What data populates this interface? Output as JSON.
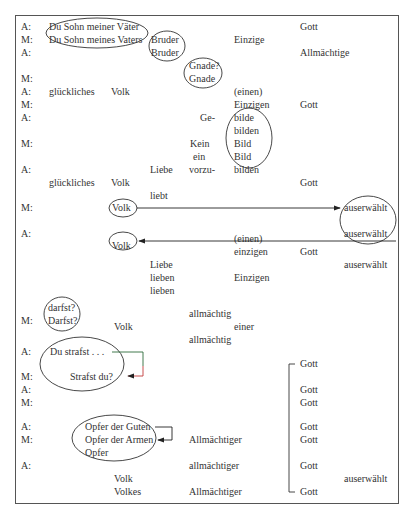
{
  "speakers": [
    {
      "label": "A:",
      "x": 21,
      "y": 21
    },
    {
      "label": "M:",
      "x": 21,
      "y": 34
    },
    {
      "label": "A:",
      "x": 21,
      "y": 47
    },
    {
      "label": "M:",
      "x": 21,
      "y": 73
    },
    {
      "label": "A:",
      "x": 21,
      "y": 86
    },
    {
      "label": "M:",
      "x": 21,
      "y": 99
    },
    {
      "label": "A:",
      "x": 21,
      "y": 112
    },
    {
      "label": "M:",
      "x": 21,
      "y": 138
    },
    {
      "label": "A:",
      "x": 21,
      "y": 164
    },
    {
      "label": "M:",
      "x": 21,
      "y": 202
    },
    {
      "label": "A:",
      "x": 21,
      "y": 228
    },
    {
      "label": "M:",
      "x": 21,
      "y": 315
    },
    {
      "label": "A:",
      "x": 21,
      "y": 346
    },
    {
      "label": "M:",
      "x": 21,
      "y": 371
    },
    {
      "label": "A:",
      "x": 21,
      "y": 384
    },
    {
      "label": "M:",
      "x": 21,
      "y": 397
    },
    {
      "label": "A:",
      "x": 21,
      "y": 421
    },
    {
      "label": "M:",
      "x": 21,
      "y": 434
    },
    {
      "label": "A:",
      "x": 21,
      "y": 460
    }
  ],
  "words": [
    {
      "text": "Du Sohn meiner Väter",
      "x": 49,
      "y": 21
    },
    {
      "text": "Du Sohn meines Vaters",
      "x": 49,
      "y": 34
    },
    {
      "text": "Bruder",
      "x": 151,
      "y": 34
    },
    {
      "text": "Bruder",
      "x": 151,
      "y": 47
    },
    {
      "text": "Einzige",
      "x": 234,
      "y": 34
    },
    {
      "text": "Gott",
      "x": 300,
      "y": 21
    },
    {
      "text": "Allmächtige",
      "x": 300,
      "y": 47
    },
    {
      "text": "Gnade?",
      "x": 189,
      "y": 60
    },
    {
      "text": "Gnade",
      "x": 189,
      "y": 73
    },
    {
      "text": "glückliches",
      "x": 49,
      "y": 86
    },
    {
      "text": "Volk",
      "x": 111,
      "y": 86
    },
    {
      "text": "(einen)",
      "x": 234,
      "y": 86
    },
    {
      "text": "Einzigen",
      "x": 234,
      "y": 99
    },
    {
      "text": "Gott",
      "x": 300,
      "y": 99
    },
    {
      "text": "Ge-",
      "x": 200,
      "y": 112
    },
    {
      "text": "bilde",
      "x": 234,
      "y": 112
    },
    {
      "text": "bilden",
      "x": 234,
      "y": 125
    },
    {
      "text": "Kein",
      "x": 190,
      "y": 138
    },
    {
      "text": "Bild",
      "x": 234,
      "y": 138
    },
    {
      "text": "ein",
      "x": 193,
      "y": 151
    },
    {
      "text": "Bild",
      "x": 234,
      "y": 151
    },
    {
      "text": "Liebe",
      "x": 150,
      "y": 164
    },
    {
      "text": "vorzu-",
      "x": 189,
      "y": 164
    },
    {
      "text": "bilden",
      "x": 234,
      "y": 164
    },
    {
      "text": "glückliches",
      "x": 49,
      "y": 177
    },
    {
      "text": "Volk",
      "x": 111,
      "y": 177
    },
    {
      "text": "Gott",
      "x": 300,
      "y": 177
    },
    {
      "text": "liebt",
      "x": 150,
      "y": 190
    },
    {
      "text": "Volk",
      "x": 112,
      "y": 202
    },
    {
      "text": "auserwählt",
      "x": 344,
      "y": 202
    },
    {
      "text": "auserwählt",
      "x": 344,
      "y": 228
    },
    {
      "text": "Volk",
      "x": 112,
      "y": 240
    },
    {
      "text": "(einen)",
      "x": 234,
      "y": 233
    },
    {
      "text": "einzigen",
      "x": 234,
      "y": 246
    },
    {
      "text": "Gott",
      "x": 300,
      "y": 246
    },
    {
      "text": "auserwählt",
      "x": 344,
      "y": 259
    },
    {
      "text": "Liebe",
      "x": 150,
      "y": 259
    },
    {
      "text": "lieben",
      "x": 150,
      "y": 272
    },
    {
      "text": "Einzigen",
      "x": 234,
      "y": 272
    },
    {
      "text": "lieben",
      "x": 150,
      "y": 285
    },
    {
      "text": "darfst?",
      "x": 48,
      "y": 302
    },
    {
      "text": "Darfst?",
      "x": 48,
      "y": 315
    },
    {
      "text": "allmächtig",
      "x": 189,
      "y": 308
    },
    {
      "text": "Volk",
      "x": 114,
      "y": 321
    },
    {
      "text": "einer",
      "x": 234,
      "y": 321
    },
    {
      "text": "allmächtig",
      "x": 189,
      "y": 334
    },
    {
      "text": "Du strafst . . .",
      "x": 50,
      "y": 346
    },
    {
      "text": "Strafst du?",
      "x": 70,
      "y": 371
    },
    {
      "text": "Gott",
      "x": 300,
      "y": 358
    },
    {
      "text": "Gott",
      "x": 300,
      "y": 384
    },
    {
      "text": "Gott",
      "x": 300,
      "y": 397
    },
    {
      "text": "Opfer der Guten",
      "x": 85,
      "y": 421
    },
    {
      "text": "Opfer der Armen",
      "x": 85,
      "y": 434
    },
    {
      "text": "Opfer",
      "x": 85,
      "y": 447
    },
    {
      "text": "Gott",
      "x": 300,
      "y": 421
    },
    {
      "text": "Allmächtiger",
      "x": 189,
      "y": 434
    },
    {
      "text": "Gott",
      "x": 300,
      "y": 434
    },
    {
      "text": "allmächtiger",
      "x": 189,
      "y": 460
    },
    {
      "text": "Gott",
      "x": 300,
      "y": 460
    },
    {
      "text": "Volk",
      "x": 114,
      "y": 473
    },
    {
      "text": "auserwählt",
      "x": 344,
      "y": 473
    },
    {
      "text": "Volkes",
      "x": 114,
      "y": 486
    },
    {
      "text": "Allmächtiger",
      "x": 189,
      "y": 486
    },
    {
      "text": "Gott",
      "x": 300,
      "y": 486
    }
  ],
  "annotations": {
    "ellipse_color": "#333333",
    "bracket_color_top": "#2e6b3a",
    "bracket_color_bottom": "#c23a3a"
  }
}
